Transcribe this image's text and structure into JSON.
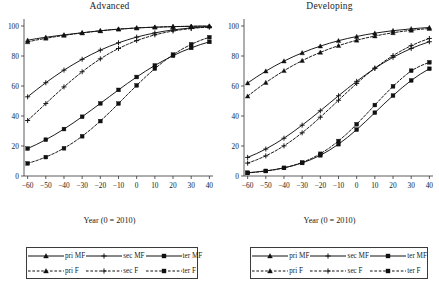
{
  "figure": {
    "panels": [
      {
        "id": "advanced",
        "title": "Advanced",
        "xlabel": "Year (0 = 2010)"
      },
      {
        "id": "developing",
        "title": "Developing",
        "xlabel": "Year (0 = 2010)"
      }
    ]
  },
  "legend": {
    "entries": [
      {
        "key": "pri-mf",
        "label": "pri MF",
        "marker": "triangle",
        "dash": "solid"
      },
      {
        "key": "sec-mf",
        "label": "sec MF",
        "marker": "plus",
        "dash": "solid"
      },
      {
        "key": "ter-mf",
        "label": "ter MF",
        "marker": "square",
        "dash": "solid"
      },
      {
        "key": "pri-f",
        "label": "pri F",
        "marker": "triangle",
        "dash": "dashed"
      },
      {
        "key": "sec-f",
        "label": "sec F",
        "marker": "plus",
        "dash": "dashed"
      },
      {
        "key": "ter-f",
        "label": "ter F",
        "marker": "square",
        "dash": "dashed"
      }
    ]
  },
  "chart_data": [
    {
      "type": "line",
      "title": "Advanced",
      "xlabel": "Year (0 = 2010)",
      "ylabel": "",
      "xlim": [
        -62,
        42
      ],
      "ylim": [
        0,
        104
      ],
      "xticks": [
        -60,
        -50,
        -40,
        -30,
        -20,
        -10,
        0,
        10,
        20,
        30,
        40
      ],
      "yticks": [
        0,
        20,
        40,
        60,
        80,
        100
      ],
      "grid": false,
      "legend_position": "below",
      "x": [
        -60,
        -55,
        -50,
        -45,
        -40,
        -35,
        -30,
        -25,
        -20,
        -15,
        -10,
        -5,
        0,
        5,
        10,
        15,
        20,
        25,
        30,
        35,
        40
      ],
      "series": [
        {
          "name": "pri MF",
          "marker": "triangle",
          "dash": "solid",
          "values": [
            90.5,
            91.6,
            92.5,
            93.3,
            94.1,
            94.8,
            95.5,
            96.2,
            96.8,
            97.4,
            97.9,
            98.3,
            98.7,
            99.0,
            99.2,
            99.4,
            99.6,
            99.7,
            99.8,
            99.9,
            99.9
          ]
        },
        {
          "name": "pri F",
          "marker": "triangle",
          "dash": "dashed",
          "values": [
            89.4,
            90.7,
            91.8,
            92.8,
            93.7,
            94.6,
            95.4,
            96.1,
            96.8,
            97.4,
            97.9,
            98.3,
            98.7,
            99.0,
            99.2,
            99.4,
            99.6,
            99.7,
            99.8,
            99.9,
            99.9
          ]
        },
        {
          "name": "sec MF",
          "marker": "plus",
          "dash": "solid",
          "values": [
            52.8,
            57.6,
            62.2,
            66.5,
            70.6,
            74.3,
            77.8,
            81.0,
            83.9,
            86.5,
            88.8,
            90.8,
            92.6,
            94.1,
            95.4,
            96.5,
            97.4,
            98.1,
            98.7,
            99.2,
            99.5
          ]
        },
        {
          "name": "sec F",
          "marker": "plus",
          "dash": "dashed",
          "values": [
            37.0,
            42.6,
            48.3,
            53.9,
            59.4,
            64.6,
            69.5,
            74.0,
            78.1,
            81.8,
            85.0,
            87.8,
            90.3,
            92.3,
            94.1,
            95.5,
            96.7,
            97.6,
            98.3,
            98.9,
            99.3
          ]
        },
        {
          "name": "ter MF",
          "marker": "square",
          "dash": "solid",
          "values": [
            18.3,
            21.1,
            24.2,
            27.6,
            31.3,
            35.3,
            39.5,
            43.9,
            48.4,
            52.9,
            57.4,
            61.8,
            66.0,
            70.0,
            73.7,
            77.1,
            80.2,
            83.0,
            85.4,
            87.6,
            89.4
          ]
        },
        {
          "name": "ter F",
          "marker": "square",
          "dash": "dashed",
          "values": [
            8.4,
            10.3,
            12.6,
            15.3,
            18.5,
            22.2,
            26.5,
            31.3,
            36.6,
            42.3,
            48.3,
            54.4,
            60.4,
            66.2,
            71.6,
            76.5,
            80.9,
            84.6,
            87.8,
            90.4,
            92.5
          ]
        }
      ]
    },
    {
      "type": "line",
      "title": "Developing",
      "xlabel": "Year (0 = 2010)",
      "ylabel": "",
      "xlim": [
        -62,
        42
      ],
      "ylim": [
        0,
        104
      ],
      "xticks": [
        -60,
        -50,
        -40,
        -30,
        -20,
        -10,
        0,
        10,
        20,
        30,
        40
      ],
      "yticks": [
        0,
        20,
        40,
        60,
        80,
        100
      ],
      "grid": false,
      "legend_position": "below",
      "x": [
        -60,
        -55,
        -50,
        -45,
        -40,
        -35,
        -30,
        -25,
        -20,
        -15,
        -10,
        -5,
        0,
        5,
        10,
        15,
        20,
        25,
        30,
        35,
        40
      ],
      "series": [
        {
          "name": "pri MF",
          "marker": "triangle",
          "dash": "solid",
          "values": [
            62.0,
            66.1,
            69.9,
            73.4,
            76.6,
            79.5,
            82.1,
            84.5,
            86.6,
            88.5,
            90.2,
            91.7,
            93.0,
            94.2,
            95.2,
            96.1,
            96.9,
            97.5,
            98.1,
            98.6,
            99.0
          ]
        },
        {
          "name": "pri F",
          "marker": "triangle",
          "dash": "dashed",
          "values": [
            53.2,
            57.9,
            62.3,
            66.4,
            70.2,
            73.7,
            76.9,
            79.8,
            82.4,
            84.8,
            86.9,
            88.8,
            90.5,
            92.0,
            93.3,
            94.5,
            95.5,
            96.4,
            97.1,
            97.8,
            98.3
          ]
        },
        {
          "name": "sec MF",
          "marker": "plus",
          "dash": "solid",
          "values": [
            12.4,
            15.0,
            18.0,
            21.4,
            25.2,
            29.4,
            33.9,
            38.6,
            43.5,
            48.5,
            53.5,
            58.4,
            63.1,
            67.6,
            71.8,
            75.6,
            79.1,
            82.2,
            85.0,
            87.4,
            89.5
          ]
        },
        {
          "name": "sec F",
          "marker": "plus",
          "dash": "dashed",
          "values": [
            8.6,
            10.8,
            13.4,
            16.5,
            20.1,
            24.2,
            28.8,
            33.8,
            39.2,
            44.8,
            50.5,
            56.2,
            61.7,
            67.0,
            71.9,
            76.3,
            80.3,
            83.8,
            86.9,
            89.5,
            91.7
          ]
        },
        {
          "name": "ter MF",
          "marker": "square",
          "dash": "solid",
          "values": [
            2.2,
            2.7,
            3.4,
            4.3,
            5.4,
            6.9,
            8.7,
            11.0,
            13.8,
            17.2,
            21.2,
            25.8,
            30.9,
            36.4,
            42.2,
            48.0,
            53.6,
            58.9,
            63.7,
            67.9,
            71.5
          ]
        },
        {
          "name": "ter F",
          "marker": "square",
          "dash": "dashed",
          "values": [
            2.0,
            2.6,
            3.3,
            4.2,
            5.4,
            7.0,
            9.0,
            11.6,
            14.8,
            18.7,
            23.3,
            28.6,
            34.5,
            40.8,
            47.3,
            53.7,
            59.8,
            65.3,
            70.2,
            73.4,
            75.8
          ]
        }
      ]
    }
  ]
}
